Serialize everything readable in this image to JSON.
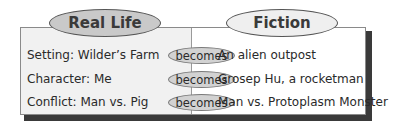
{
  "headers": {
    "left": "Real Life",
    "right": "Fiction"
  },
  "connector_label": "becomes",
  "rows": [
    {
      "real": "Setting: Wilder’s Farm",
      "fiction": "An alien outpost"
    },
    {
      "real": "Character: Me",
      "fiction": "Grosep Hu, a rocketman"
    },
    {
      "real": "Conflict: Man vs. Pig",
      "fiction": "Man vs. Protoplasm Monster"
    }
  ],
  "colors": {
    "left_panel": "#f1f1f1",
    "real_oval": "#c9c9c9",
    "fiction_oval": "#efefef",
    "becomes_oval": "#d2d2d2",
    "shadow": "#3a3a3a"
  }
}
